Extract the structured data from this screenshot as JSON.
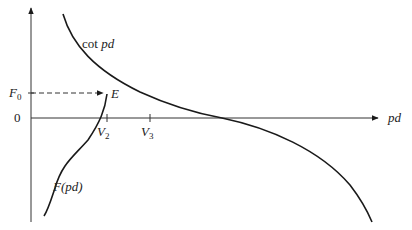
{
  "diagram": {
    "x_axis_label": "pd",
    "y_axis_origin_label": "0",
    "f0_label_main": "F",
    "f0_label_sub": "0",
    "point_label": "E",
    "ticks": [
      {
        "main": "V",
        "sub": "2"
      },
      {
        "main": "V",
        "sub": "3"
      }
    ],
    "curve_cot_label_prefix": "cot ",
    "curve_cot_label_arg": "pd",
    "curve_f_label_main": "F",
    "curve_f_label_arg": "(pd)",
    "colors": {
      "line": "#1a1a1a",
      "axis": "#333333"
    }
  }
}
